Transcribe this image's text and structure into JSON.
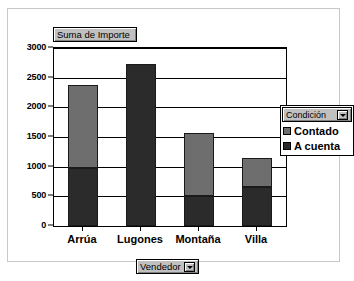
{
  "panel": {
    "title_field": "Suma de Importe",
    "category_field": "Vendedor",
    "dropdown_icon": "chevron-down-icon"
  },
  "legend": {
    "title": "Condición",
    "dropdown_icon": "chevron-down-icon",
    "entries": [
      {
        "label": "Contado",
        "color": "#6e6e6e"
      },
      {
        "label": "A cuenta",
        "color": "#2b2b2b"
      }
    ]
  },
  "chart_data": {
    "type": "bar",
    "title": "Suma de Importe",
    "xlabel": "Vendedor",
    "ylabel": "",
    "stacked": true,
    "grid": true,
    "legend_position": "right",
    "categories": [
      "Arrúa",
      "Lugones",
      "Montaña",
      "Villa"
    ],
    "ylim": [
      0,
      3000
    ],
    "yticks": [
      0,
      500,
      1000,
      1500,
      2000,
      2500,
      3000
    ],
    "ytick_labels": [
      "0",
      "500",
      "1000",
      "1500",
      "2000",
      "2500",
      "3000"
    ],
    "series": [
      {
        "name": "A cuenta",
        "color": "#2b2b2b",
        "values": [
          970,
          2730,
          500,
          650
        ]
      },
      {
        "name": "Contado",
        "color": "#6e6e6e",
        "values": [
          1405,
          0,
          1070,
          500
        ]
      }
    ],
    "totals": [
      2375,
      2730,
      1570,
      1150
    ]
  }
}
